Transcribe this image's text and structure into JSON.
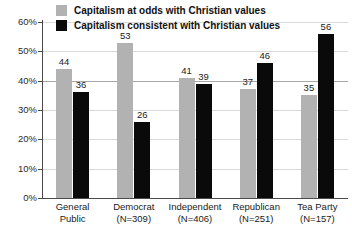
{
  "chart_data": {
    "type": "bar",
    "title": "",
    "xlabel": "",
    "ylabel": "",
    "ylim": [
      0,
      60
    ],
    "ytick_labels": [
      "0%",
      "10%",
      "20%",
      "30%",
      "40%",
      "50%",
      "60%"
    ],
    "ytick_values": [
      0,
      10,
      20,
      30,
      40,
      50,
      60
    ],
    "grid": true,
    "legend_position": "top-left",
    "categories": [
      "General Public",
      "Democrat (N=309)",
      "Independent (N=406)",
      "Republican (N=251)",
      "Tea Party (N=157)"
    ],
    "category_lines": [
      {
        "line1": "General",
        "line2": "Public"
      },
      {
        "line1": "Democrat",
        "line2": "(N=309)"
      },
      {
        "line1": "Independent",
        "line2": "(N=406)"
      },
      {
        "line1": "Republican",
        "line2": "(N=251)"
      },
      {
        "line1": "Tea Party",
        "line2": "(N=157)"
      }
    ],
    "series": [
      {
        "name": "Capitalism at odds with Christian values",
        "color": "#b2b2b2",
        "values": [
          44,
          53,
          41,
          37,
          35
        ]
      },
      {
        "name": "Capitalism consistent with Christian values",
        "color": "#0a0a0a",
        "values": [
          36,
          26,
          39,
          46,
          56
        ]
      }
    ]
  },
  "legend": {
    "items": [
      {
        "label": "Capitalism at odds with Christian values",
        "swatch": "gray"
      },
      {
        "label": "Capitalism consistent with Christian values",
        "swatch": "black"
      }
    ]
  }
}
